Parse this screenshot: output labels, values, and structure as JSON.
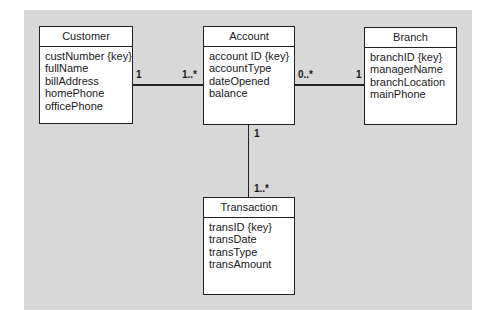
{
  "diagram": {
    "type": "UML class diagram",
    "background_color": "#d8d8d8",
    "classes": [
      {
        "name": "Customer",
        "attributes": [
          "custNumber {key}",
          "fullName",
          "billAddress",
          "homePhone",
          "officePhone"
        ]
      },
      {
        "name": "Account",
        "attributes": [
          "account ID {key}",
          "accountType",
          "dateOpened",
          "balance"
        ]
      },
      {
        "name": "Branch",
        "attributes": [
          "branchID {key}",
          "managerName",
          "branchLocation",
          "mainPhone"
        ]
      },
      {
        "name": "Transaction",
        "attributes": [
          "transID {key}",
          "transDate",
          "transType",
          "transAmount"
        ]
      }
    ],
    "associations": [
      {
        "from": "Customer",
        "to": "Account",
        "from_mult": "1",
        "to_mult": "1..*"
      },
      {
        "from": "Account",
        "to": "Branch",
        "from_mult": "0..*",
        "to_mult": "1"
      },
      {
        "from": "Account",
        "to": "Transaction",
        "from_mult": "1",
        "to_mult": "1..*"
      }
    ]
  }
}
